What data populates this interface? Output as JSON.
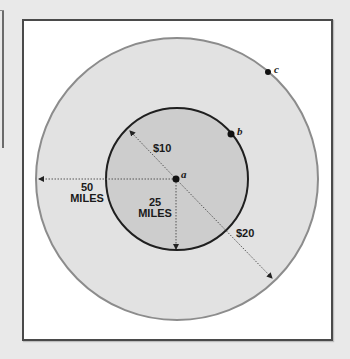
{
  "diagram": {
    "colors": {
      "background": "#e9e9e9",
      "frame_fill": "#ffffff",
      "frame_border": "#4a4a4a",
      "outer_circle_fill": "#e2e2e2",
      "outer_circle_stroke": "#8c8c8c",
      "inner_circle_fill": "#cdcdcd",
      "inner_circle_stroke": "#1f1f1f",
      "line": "#555555"
    },
    "points": {
      "a": "a",
      "b": "b",
      "c": "c"
    },
    "labels": {
      "inner_price": "$10",
      "outer_price": "$20",
      "outer_radius_value": "50",
      "outer_radius_unit": "MILES",
      "inner_radius_value": "25",
      "inner_radius_unit": "MILES"
    }
  }
}
